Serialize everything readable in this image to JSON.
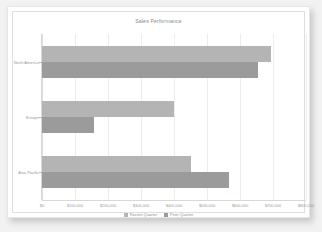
{
  "chart_data": {
    "type": "bar",
    "orientation": "horizontal",
    "title": "Sales Performance",
    "xlabel": "",
    "ylabel": "",
    "xlim": [
      0,
      800000
    ],
    "grid": true,
    "legend_position": "bottom",
    "categories": [
      "North America",
      "Europe",
      "Asia Pacific"
    ],
    "xticks": [
      0,
      100000,
      200000,
      300000,
      400000,
      500000,
      600000,
      700000,
      800000
    ],
    "xtick_labels": [
      "$0",
      "$100,000",
      "$200,000",
      "$300,000",
      "$400,000",
      "$500,000",
      "$600,000",
      "$700,000",
      "$800,000"
    ],
    "series": [
      {
        "name": "Recent Quarter",
        "color": "#b4b4b4",
        "values": [
          693000,
          400000,
          452000
        ]
      },
      {
        "name": "Prior Quarter",
        "color": "#9b9b9b",
        "values": [
          655000,
          158000,
          568000
        ]
      }
    ]
  }
}
